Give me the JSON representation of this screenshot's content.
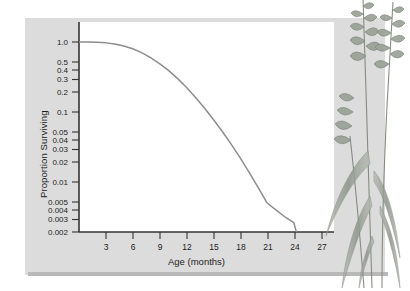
{
  "figure": {
    "background_color": "#ffffff",
    "panel_color": "#dcdcdc",
    "plot_background": "#ffffff",
    "axis_color": "#333333",
    "curve_color": "#8d8d8d",
    "text_color": "#1c1c1c",
    "illustration": "grass-plant-illustration"
  },
  "chart_data": {
    "type": "line",
    "title": "",
    "subtitle": "",
    "xlabel": "Age (months)",
    "ylabel": "Proportion Surviving",
    "yscale": "log",
    "xscale": "linear",
    "grid": false,
    "legend": null,
    "legend_position": "none",
    "xlim": [
      0,
      28.5
    ],
    "ylim": [
      0.0017,
      1.15
    ],
    "xticks": [
      3,
      6,
      9,
      12,
      15,
      18,
      21,
      24,
      27
    ],
    "xtick_labels": [
      "3",
      "6",
      "9",
      "12",
      "15",
      "18",
      "21",
      "24",
      "27"
    ],
    "yticks": [
      1.0,
      0.5,
      0.4,
      0.3,
      0.2,
      0.1,
      0.05,
      0.04,
      0.03,
      0.02,
      0.01,
      0.005,
      0.004,
      0.003,
      0.002
    ],
    "ytick_labels": [
      "1.0",
      "0.5",
      "0.4",
      "0.3",
      "0.2",
      "0.1",
      "0.05",
      "0.04",
      "0.03",
      "0.02",
      "0.01",
      "0.005",
      "0.004",
      "0.003",
      "0.002"
    ],
    "series": [
      {
        "name": "Survivorship",
        "curve_type": "type-I-survivorship",
        "x": [
          0,
          1,
          2,
          3,
          4,
          5,
          6,
          7,
          8,
          9,
          10,
          11,
          12,
          13,
          14,
          15,
          16,
          17,
          18,
          19,
          20,
          21,
          22,
          23,
          24
        ],
        "y": [
          1.0,
          1.0,
          0.99,
          0.97,
          0.93,
          0.87,
          0.79,
          0.69,
          0.58,
          0.47,
          0.37,
          0.28,
          0.205,
          0.145,
          0.1,
          0.067,
          0.044,
          0.028,
          0.0175,
          0.0105,
          0.0062,
          0.0036,
          0.0028,
          0.0022,
          0.0018
        ]
      }
    ]
  }
}
